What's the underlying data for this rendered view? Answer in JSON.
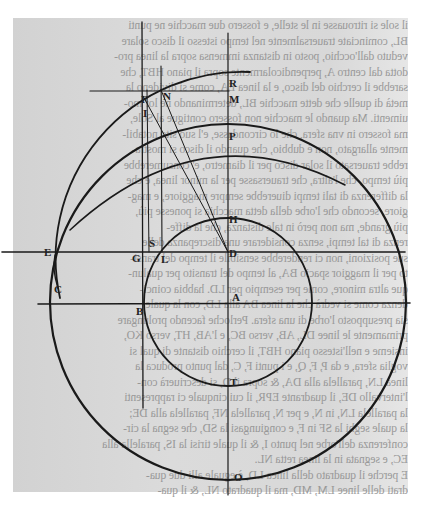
{
  "document": {
    "kind": "scanned printed page with geometric figure (mirrored show-through text)",
    "text_lines": [
      "il sole si ritrouasse in le stelle, e fossero due macchie ne punti",
      "BL, cominciate trauersalmente nel tempo istesso il disco solare",
      "veduto dall'occhio, posto in distanza immensa sopra la linea pro-",
      "dotta dal centro A, perpendicolarmente sopra il piano HBT, che",
      "sarebbe il cerchio del disco, e la linea EA, come si divideno la",
      "metà di quelle che dette macchie BL, determinando ne lor mo-",
      "uimenti. Ma quando le macchie non fossero contigue al Sole,",
      "ma fossero in vna sfera, che lo circondasse, e'l suo sito notabil-",
      "mente allargato, non è dubbio, che quando il disco si mostra-",
      "rebbe trauersato il solar disco per il diametro, e' consumerebbe",
      "più tempo, che l'altra, che trauersasse per la minor linea, e che",
      "la differenza di tali tempi diuerebbe sempre maggiore, e mag-",
      "giore, secondo che l'orbe della detta macchia si ponesse più,",
      "più grande, ma non però in tale distanza, che la diffe-",
      "renza di tal tempi, senza considerare una discrepanza delle",
      "sue posizioni, non ci renderebbe sensibile il tempo del transi-",
      "to per il maggior spacio BA, al tempo del transito per qualun-",
      "que altra minore, come per esempio per LD. habbia coinci-",
      "denza come si vedrà che la linea BA alla LD, con la quale",
      "sia presupposto l'orbe di una sfera. Perloche facendo prolungare",
      "primamente le linee DL, AB, verso BC, e l'AB, HT, verso KO,",
      "insieme e nell'istesso piano HBT, il cerchio distante di qual si",
      "voglia sfera, e da P, F, Q, e i punti F, C, dal punto produca la",
      "linea LN, parallela alla DA, & sopra il D, si descriuerà con-",
      "l'intervallo DE, il quadrante EPR, il cui cinquale ci rappresenti",
      "la parallela LN, in N, e per N, parallela NF, parallela alla DE;",
      "la quale seghi la SF in F, e congiungasi la SD, che segna la cir-",
      "conferenza dell'orbe nel punto I, & il quale tirisi la IS, paralella alla",
      "EC, e segnata in la linea retta NL.",
      "E perche il quadrato della linea LD, è eguale alli due qua-",
      "drati delle linee LM, MD, ma il quadrato NL, & il qua-"
    ]
  },
  "figure": {
    "labels": [
      {
        "text": "R",
        "x": 229,
        "y": 87
      },
      {
        "text": "F",
        "x": 141,
        "y": 103
      },
      {
        "text": "N",
        "x": 163,
        "y": 100
      },
      {
        "text": "M",
        "x": 229,
        "y": 103
      },
      {
        "text": "I",
        "x": 143,
        "y": 117
      },
      {
        "text": "P",
        "x": 229,
        "y": 140
      },
      {
        "text": "H",
        "x": 229,
        "y": 223
      },
      {
        "text": "E",
        "x": 44,
        "y": 256
      },
      {
        "text": "D",
        "x": 229,
        "y": 257
      },
      {
        "text": "S",
        "x": 149,
        "y": 247
      },
      {
        "text": "G",
        "x": 132,
        "y": 262
      },
      {
        "text": "L",
        "x": 161,
        "y": 263
      },
      {
        "text": "C",
        "x": 54,
        "y": 293
      },
      {
        "text": "A",
        "x": 232,
        "y": 301
      },
      {
        "text": "B",
        "x": 136,
        "y": 315
      },
      {
        "text": "T",
        "x": 230,
        "y": 386
      },
      {
        "text": "O",
        "x": 234,
        "y": 481
      }
    ],
    "line_color": "#1a1a1a",
    "page_color": "#d6d6d6"
  }
}
